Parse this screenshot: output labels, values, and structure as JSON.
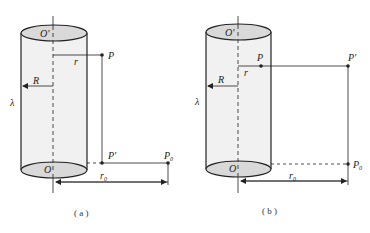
{
  "figure": {
    "panels": [
      {
        "id": "a",
        "caption": "( a )",
        "labels": {
          "top_center": "O'",
          "bottom_center": "O",
          "point_p": "P",
          "point_p_prime": "P'",
          "point_p0": "P",
          "point_p0_sub": "0",
          "radius_cylinder": "R",
          "radius_r": "r",
          "radius_r0": "r",
          "radius_r0_sub": "0",
          "charge_density": "λ"
        }
      },
      {
        "id": "b",
        "caption": "( b )",
        "labels": {
          "top_center": "O'",
          "bottom_center": "O",
          "point_p": "P",
          "point_p_prime": "P'",
          "point_p0": "P",
          "point_p0_sub": "0",
          "radius_cylinder": "R",
          "radius_r": "r",
          "radius_r0": "r",
          "radius_r0_sub": "0",
          "charge_density": "λ"
        }
      }
    ],
    "colors": {
      "stroke": "#222222",
      "cylinder_fill": "#f1f1f1",
      "ellipse_fill": "#d9d9d9"
    }
  }
}
